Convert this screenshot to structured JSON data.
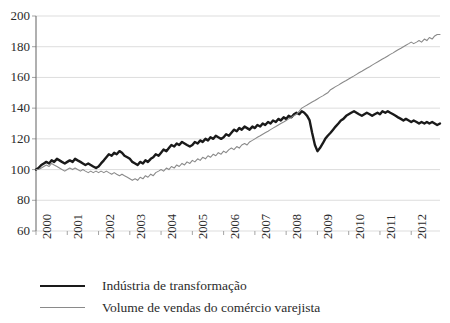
{
  "chart_data": {
    "type": "line",
    "title": "",
    "subtitle": "",
    "xlabel": "",
    "ylabel": "",
    "xlim": [
      2000,
      2012.92
    ],
    "ylim": [
      60,
      200
    ],
    "y_ticks": [
      60,
      80,
      100,
      120,
      140,
      160,
      180,
      200
    ],
    "x_ticks": [
      2000,
      2001,
      2002,
      2003,
      2004,
      2005,
      2006,
      2007,
      2008,
      2009,
      2010,
      2011,
      2012
    ],
    "x_tick_labels": [
      "2000",
      "2001",
      "2002",
      "2003",
      "2004",
      "2005",
      "2006",
      "2007",
      "2008",
      "2009",
      "2010",
      "2011",
      "2012"
    ],
    "grid": "horizontal",
    "legend_position": "bottom-left",
    "colors": {
      "industry": "#1a1a1a",
      "retail": "#8a8a8a"
    },
    "series": [
      {
        "name": "Indústria de transformação",
        "color": "#1a1a1a",
        "line_width": 2.4,
        "x": [
          2000.0,
          2000.08,
          2000.17,
          2000.25,
          2000.33,
          2000.42,
          2000.5,
          2000.58,
          2000.67,
          2000.75,
          2000.83,
          2000.92,
          2001.0,
          2001.08,
          2001.17,
          2001.25,
          2001.33,
          2001.42,
          2001.5,
          2001.58,
          2001.67,
          2001.75,
          2001.83,
          2001.92,
          2002.0,
          2002.08,
          2002.17,
          2002.25,
          2002.33,
          2002.42,
          2002.5,
          2002.58,
          2002.67,
          2002.75,
          2002.83,
          2002.92,
          2003.0,
          2003.08,
          2003.17,
          2003.25,
          2003.33,
          2003.42,
          2003.5,
          2003.58,
          2003.67,
          2003.75,
          2003.83,
          2003.92,
          2004.0,
          2004.08,
          2004.17,
          2004.25,
          2004.33,
          2004.42,
          2004.5,
          2004.58,
          2004.67,
          2004.75,
          2004.83,
          2004.92,
          2005.0,
          2005.08,
          2005.17,
          2005.25,
          2005.33,
          2005.42,
          2005.5,
          2005.58,
          2005.67,
          2005.75,
          2005.83,
          2005.92,
          2006.0,
          2006.08,
          2006.17,
          2006.25,
          2006.33,
          2006.42,
          2006.5,
          2006.58,
          2006.67,
          2006.75,
          2006.83,
          2006.92,
          2007.0,
          2007.08,
          2007.17,
          2007.25,
          2007.33,
          2007.42,
          2007.5,
          2007.58,
          2007.67,
          2007.75,
          2007.83,
          2007.92,
          2008.0,
          2008.08,
          2008.17,
          2008.25,
          2008.33,
          2008.42,
          2008.5,
          2008.58,
          2008.67,
          2008.75,
          2008.83,
          2008.92,
          2009.0,
          2009.08,
          2009.17,
          2009.25,
          2009.33,
          2009.42,
          2009.5,
          2009.58,
          2009.67,
          2009.75,
          2009.83,
          2009.92,
          2010.0,
          2010.08,
          2010.17,
          2010.25,
          2010.33,
          2010.42,
          2010.5,
          2010.58,
          2010.67,
          2010.75,
          2010.83,
          2010.92,
          2011.0,
          2011.08,
          2011.17,
          2011.25,
          2011.33,
          2011.42,
          2011.5,
          2011.58,
          2011.67,
          2011.75,
          2011.83,
          2011.92,
          2012.0,
          2012.08,
          2012.17,
          2012.25,
          2012.33,
          2012.42,
          2012.5,
          2012.58,
          2012.67,
          2012.75,
          2012.83,
          2012.92
        ],
        "values": [
          100,
          101,
          103,
          104,
          105,
          104,
          106,
          105,
          107,
          106,
          105,
          104,
          105,
          106,
          105,
          107,
          106,
          105,
          104,
          103,
          104,
          103,
          102,
          101,
          102,
          104,
          106,
          108,
          110,
          109,
          111,
          110,
          112,
          111,
          109,
          108,
          107,
          105,
          104,
          103,
          105,
          104,
          106,
          105,
          107,
          108,
          110,
          109,
          111,
          113,
          112,
          114,
          116,
          115,
          117,
          116,
          118,
          117,
          116,
          115,
          116,
          118,
          117,
          119,
          118,
          120,
          119,
          121,
          120,
          122,
          121,
          120,
          121,
          123,
          122,
          124,
          126,
          125,
          127,
          126,
          128,
          127,
          126,
          128,
          127,
          129,
          128,
          130,
          129,
          131,
          130,
          132,
          131,
          133,
          132,
          134,
          133,
          135,
          134,
          136,
          137,
          136,
          138,
          137,
          135,
          132,
          124,
          116,
          112,
          114,
          117,
          120,
          122,
          124,
          126,
          128,
          130,
          132,
          133,
          135,
          136,
          137,
          138,
          137,
          136,
          135,
          136,
          137,
          136,
          135,
          136,
          137,
          136,
          138,
          137,
          138,
          137,
          136,
          135,
          134,
          133,
          132,
          133,
          132,
          131,
          132,
          131,
          130,
          131,
          130,
          131,
          130,
          131,
          130,
          129,
          130
        ]
      },
      {
        "name": "Volume de vendas do comércio varejista",
        "color": "#8a8a8a",
        "line_width": 1.1,
        "x": [
          2000.0,
          2000.08,
          2000.17,
          2000.25,
          2000.33,
          2000.42,
          2000.5,
          2000.58,
          2000.67,
          2000.75,
          2000.83,
          2000.92,
          2001.0,
          2001.08,
          2001.17,
          2001.25,
          2001.33,
          2001.42,
          2001.5,
          2001.58,
          2001.67,
          2001.75,
          2001.83,
          2001.92,
          2002.0,
          2002.08,
          2002.17,
          2002.25,
          2002.33,
          2002.42,
          2002.5,
          2002.58,
          2002.67,
          2002.75,
          2002.83,
          2002.92,
          2003.0,
          2003.08,
          2003.17,
          2003.25,
          2003.33,
          2003.42,
          2003.5,
          2003.58,
          2003.67,
          2003.75,
          2003.83,
          2003.92,
          2004.0,
          2004.08,
          2004.17,
          2004.25,
          2004.33,
          2004.42,
          2004.5,
          2004.58,
          2004.67,
          2004.75,
          2004.83,
          2004.92,
          2005.0,
          2005.08,
          2005.17,
          2005.25,
          2005.33,
          2005.42,
          2005.5,
          2005.58,
          2005.67,
          2005.75,
          2005.83,
          2005.92,
          2006.0,
          2006.08,
          2006.17,
          2006.25,
          2006.33,
          2006.42,
          2006.5,
          2006.58,
          2006.67,
          2006.75,
          2006.83,
          2006.92,
          2007.0,
          2007.08,
          2007.17,
          2007.25,
          2007.33,
          2007.42,
          2007.5,
          2007.58,
          2007.67,
          2007.75,
          2007.83,
          2007.92,
          2008.0,
          2008.08,
          2008.17,
          2008.25,
          2008.33,
          2008.42,
          2008.5,
          2008.58,
          2008.67,
          2008.75,
          2008.83,
          2008.92,
          2009.0,
          2009.08,
          2009.17,
          2009.25,
          2009.33,
          2009.42,
          2009.5,
          2009.58,
          2009.67,
          2009.75,
          2009.83,
          2009.92,
          2010.0,
          2010.08,
          2010.17,
          2010.25,
          2010.33,
          2010.42,
          2010.5,
          2010.58,
          2010.67,
          2010.75,
          2010.83,
          2010.92,
          2011.0,
          2011.08,
          2011.17,
          2011.25,
          2011.33,
          2011.42,
          2011.5,
          2011.58,
          2011.67,
          2011.75,
          2011.83,
          2011.92,
          2012.0,
          2012.08,
          2012.17,
          2012.25,
          2012.33,
          2012.42,
          2012.5,
          2012.58,
          2012.67,
          2012.75,
          2012.83,
          2012.92
        ],
        "values": [
          100,
          100,
          101,
          102,
          103,
          102,
          104,
          103,
          102,
          101,
          100,
          99,
          100,
          101,
          100,
          101,
          100,
          99,
          100,
          99,
          98,
          99,
          98,
          99,
          98,
          99,
          98,
          99,
          98,
          97,
          98,
          97,
          96,
          97,
          96,
          95,
          94,
          93,
          94,
          93,
          95,
          94,
          96,
          95,
          97,
          96,
          98,
          99,
          100,
          99,
          101,
          100,
          102,
          101,
          103,
          102,
          104,
          103,
          105,
          104,
          106,
          105,
          107,
          106,
          108,
          107,
          109,
          108,
          110,
          109,
          111,
          110,
          112,
          111,
          113,
          114,
          113,
          115,
          114,
          116,
          117,
          116,
          118,
          119,
          120,
          121,
          122,
          123,
          124,
          125,
          126,
          127,
          128,
          129,
          130,
          131,
          132,
          133,
          134,
          135,
          136,
          138,
          140,
          141,
          142,
          143,
          144,
          145,
          146,
          147,
          148,
          149,
          150,
          152,
          153,
          154,
          155,
          156,
          157,
          158,
          159,
          160,
          161,
          162,
          163,
          164,
          165,
          166,
          167,
          168,
          169,
          170,
          171,
          172,
          173,
          174,
          175,
          176,
          177,
          178,
          179,
          180,
          181,
          182,
          183,
          182,
          183,
          184,
          183,
          185,
          184,
          186,
          185,
          187,
          188,
          188
        ]
      }
    ]
  },
  "legend": {
    "items": [
      {
        "label": "Indústria de transformação"
      },
      {
        "label": "Volume de vendas do comércio varejista"
      }
    ]
  }
}
